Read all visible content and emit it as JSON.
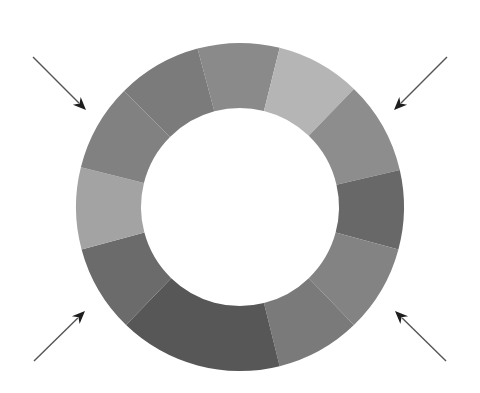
{
  "diagram": {
    "type": "segmented-ring",
    "center": [
      240,
      207
    ],
    "outer_radius": 164,
    "inner_radius": 99,
    "segments": [
      {
        "start_deg": 345,
        "end_deg": 14,
        "color": "#8a8a8a"
      },
      {
        "start_deg": 14,
        "end_deg": 44,
        "color": "#b5b5b5"
      },
      {
        "start_deg": 44,
        "end_deg": 77,
        "color": "#8d8d8d"
      },
      {
        "start_deg": 77,
        "end_deg": 105,
        "color": "#686868"
      },
      {
        "start_deg": 105,
        "end_deg": 136,
        "color": "#838383"
      },
      {
        "start_deg": 136,
        "end_deg": 166,
        "color": "#7a7a7a"
      },
      {
        "start_deg": 166,
        "end_deg": 224,
        "color": "#575757"
      },
      {
        "start_deg": 224,
        "end_deg": 255,
        "color": "#6b6b6b"
      },
      {
        "start_deg": 255,
        "end_deg": 284,
        "color": "#a3a3a3"
      },
      {
        "start_deg": 284,
        "end_deg": 315,
        "color": "#818181"
      },
      {
        "start_deg": 315,
        "end_deg": 345,
        "color": "#7b7b7b"
      }
    ],
    "arrows": [
      {
        "name": "arrow-top-left",
        "from": [
          33,
          57
        ],
        "to": [
          86,
          110
        ]
      },
      {
        "name": "arrow-top-right",
        "from": [
          447,
          57
        ],
        "to": [
          394,
          110
        ]
      },
      {
        "name": "arrow-bottom-left",
        "from": [
          34,
          361
        ],
        "to": [
          85,
          311
        ]
      },
      {
        "name": "arrow-bottom-right",
        "from": [
          446,
          361
        ],
        "to": [
          395,
          311
        ]
      }
    ]
  }
}
